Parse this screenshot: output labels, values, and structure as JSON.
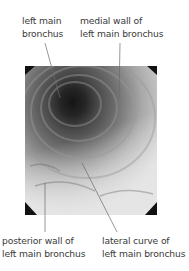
{
  "figure": {
    "labels": {
      "top_left": [
        "left main",
        "bronchus"
      ],
      "top_right": [
        "medial wall of",
        "left main bronchus"
      ],
      "bottom_left": [
        "posterior wall of",
        "left main bronchus"
      ],
      "bottom_right": [
        "lateral curve of",
        "left main bronchus"
      ]
    },
    "colors": {
      "text": "#3a3a3a",
      "leader_line": "#6a6a6a",
      "lumen_dark": "#1e1e1e",
      "mucosa_light": "#d8d8d8"
    }
  }
}
